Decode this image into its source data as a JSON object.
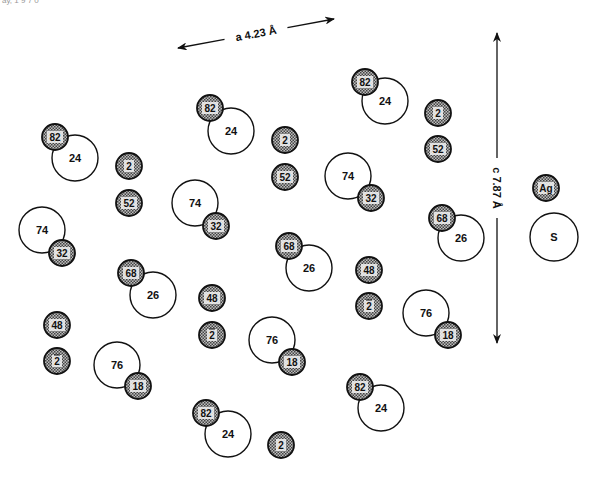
{
  "corner_text": "ay, 1 9 7 0",
  "axis_a": {
    "label": "a 4.23 Å",
    "x1": 178,
    "y1": 48,
    "x2": 334,
    "y2": 19
  },
  "axis_c": {
    "label": "c 7.87 Å",
    "x": 497,
    "y1": 33,
    "y2": 343
  },
  "legend": [
    {
      "type": "Ag",
      "label": "Ag",
      "x": 546,
      "y": 188,
      "r": 13,
      "fill": "shaded"
    },
    {
      "type": "S",
      "label": "S",
      "x": 554,
      "y": 237,
      "r": 24,
      "fill": "open"
    }
  ],
  "colors": {
    "stroke": "#111111",
    "shade": "#8a8a8a",
    "open_fill": "#ffffff",
    "text": "#111111"
  },
  "atoms_S": [
    {
      "label": "24",
      "x": 75,
      "y": 158
    },
    {
      "label": "24",
      "x": 231,
      "y": 131
    },
    {
      "label": "24",
      "x": 385,
      "y": 101
    },
    {
      "label": "74",
      "x": 42,
      "y": 230
    },
    {
      "label": "74",
      "x": 195,
      "y": 203
    },
    {
      "label": "74",
      "x": 348,
      "y": 176
    },
    {
      "label": "26",
      "x": 153,
      "y": 295
    },
    {
      "label": "26",
      "x": 309,
      "y": 268
    },
    {
      "label": "26",
      "x": 461,
      "y": 238
    },
    {
      "label": "76",
      "x": 117,
      "y": 365
    },
    {
      "label": "76",
      "x": 272,
      "y": 340
    },
    {
      "label": "76",
      "x": 426,
      "y": 313
    },
    {
      "label": "24",
      "x": 228,
      "y": 434
    },
    {
      "label": "24",
      "x": 381,
      "y": 408
    }
  ],
  "atoms_Ag": [
    {
      "label": "82",
      "x": 55,
      "y": 137
    },
    {
      "label": "82",
      "x": 210,
      "y": 108
    },
    {
      "label": "82",
      "x": 365,
      "y": 82
    },
    {
      "label": "2",
      "x": 129,
      "y": 166
    },
    {
      "label": "52",
      "x": 129,
      "y": 203
    },
    {
      "label": "2",
      "x": 285,
      "y": 140
    },
    {
      "label": "52",
      "x": 285,
      "y": 177
    },
    {
      "label": "2",
      "x": 438,
      "y": 113
    },
    {
      "label": "52",
      "x": 438,
      "y": 149
    },
    {
      "label": "32",
      "x": 62,
      "y": 253
    },
    {
      "label": "32",
      "x": 216,
      "y": 226
    },
    {
      "label": "32",
      "x": 371,
      "y": 198
    },
    {
      "label": "68",
      "x": 131,
      "y": 273
    },
    {
      "label": "68",
      "x": 289,
      "y": 246
    },
    {
      "label": "68",
      "x": 442,
      "y": 218
    },
    {
      "label": "48",
      "x": 57,
      "y": 325
    },
    {
      "label": "48",
      "x": 212,
      "y": 298
    },
    {
      "label": "48",
      "x": 369,
      "y": 270
    },
    {
      "label": "2",
      "bar": true,
      "x": 57,
      "y": 361
    },
    {
      "label": "2",
      "bar": true,
      "x": 212,
      "y": 335
    },
    {
      "label": "2",
      "bar": true,
      "x": 369,
      "y": 306
    },
    {
      "label": "18",
      "x": 138,
      "y": 386
    },
    {
      "label": "18",
      "x": 292,
      "y": 362
    },
    {
      "label": "18",
      "x": 448,
      "y": 335
    },
    {
      "label": "82",
      "x": 206,
      "y": 413
    },
    {
      "label": "82",
      "x": 360,
      "y": 387
    },
    {
      "label": "2",
      "x": 281,
      "y": 445
    }
  ],
  "radii": {
    "S": 23,
    "Ag": 13
  }
}
